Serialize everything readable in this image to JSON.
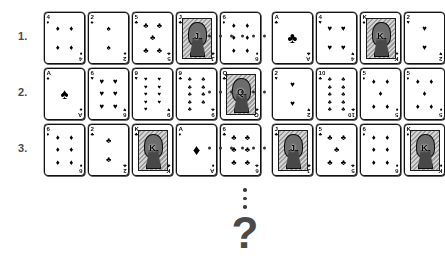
{
  "puzzle": {
    "title": "Playing card sequence puzzle",
    "row_separator_icon": "horizontal-ellipsis",
    "sequence_continuation_icon": "vertical-ellipsis",
    "answer_prompt": "?",
    "separator_dot_count": 6,
    "vertical_dot_count": 3,
    "colors": {
      "ink": "#1f1f1f",
      "paper": "#ffffff",
      "muted": "#4a4a4a",
      "face_art": "#9a9a9a"
    },
    "suit_glyphs": {
      "spades": "♠",
      "hearts": "♥",
      "diamonds": "♦",
      "clubs": "♣"
    },
    "rows": [
      {
        "label": "1.",
        "left": [
          {
            "rank": "4",
            "suit": "diamonds",
            "glyph": "♦",
            "pips": 4,
            "face": false
          },
          {
            "rank": "2",
            "suit": "spades",
            "glyph": "♠",
            "pips": 2,
            "face": false
          },
          {
            "rank": "5",
            "suit": "clubs",
            "glyph": "♣",
            "pips": 5,
            "face": false
          },
          {
            "rank": "J",
            "suit": "clubs",
            "glyph": "♣",
            "pips": 0,
            "face": true
          },
          {
            "rank": "6",
            "suit": "diamonds",
            "glyph": "♦",
            "pips": 6,
            "face": false
          }
        ],
        "right": [
          {
            "rank": "A",
            "suit": "clubs",
            "glyph": "♣",
            "pips": 1,
            "face": false
          },
          {
            "rank": "4",
            "suit": "hearts",
            "glyph": "♥",
            "pips": 4,
            "face": false
          },
          {
            "rank": "K",
            "suit": "spades",
            "glyph": "♠",
            "pips": 0,
            "face": true
          },
          {
            "rank": "2",
            "suit": "hearts",
            "glyph": "♥",
            "pips": 2,
            "face": false
          }
        ]
      },
      {
        "label": "2.",
        "left": [
          {
            "rank": "A",
            "suit": "spades",
            "glyph": "♠",
            "pips": 1,
            "face": false
          },
          {
            "rank": "6",
            "suit": "hearts",
            "glyph": "♥",
            "pips": 6,
            "face": false
          },
          {
            "rank": "9",
            "suit": "hearts",
            "glyph": "♥",
            "pips": 9,
            "face": false
          },
          {
            "rank": "9",
            "suit": "clubs",
            "glyph": "♣",
            "pips": 9,
            "face": false
          },
          {
            "rank": "Q",
            "suit": "clubs",
            "glyph": "♣",
            "pips": 0,
            "face": true
          }
        ],
        "right": [
          {
            "rank": "2",
            "suit": "hearts",
            "glyph": "♥",
            "pips": 2,
            "face": false
          },
          {
            "rank": "10",
            "suit": "clubs",
            "glyph": "♣",
            "pips": 10,
            "face": false
          },
          {
            "rank": "5",
            "suit": "diamonds",
            "glyph": "♦",
            "pips": 5,
            "face": false
          },
          {
            "rank": "5",
            "suit": "diamonds",
            "glyph": "♦",
            "pips": 5,
            "face": false
          }
        ]
      },
      {
        "label": "3.",
        "left": [
          {
            "rank": "6",
            "suit": "diamonds",
            "glyph": "♦",
            "pips": 6,
            "face": false
          },
          {
            "rank": "2",
            "suit": "clubs",
            "glyph": "♣",
            "pips": 2,
            "face": false
          },
          {
            "rank": "K",
            "suit": "clubs",
            "glyph": "♣",
            "pips": 0,
            "face": true
          },
          {
            "rank": "A",
            "suit": "diamonds",
            "glyph": "♦",
            "pips": 1,
            "face": false
          },
          {
            "rank": "6",
            "suit": "clubs",
            "glyph": "♣",
            "pips": 6,
            "face": false
          }
        ],
        "right": [
          {
            "rank": "J",
            "suit": "clubs",
            "glyph": "♣",
            "pips": 0,
            "face": true
          },
          {
            "rank": "5",
            "suit": "clubs",
            "glyph": "♣",
            "pips": 5,
            "face": false
          },
          {
            "rank": "6",
            "suit": "diamonds",
            "glyph": "♦",
            "pips": 6,
            "face": false
          },
          {
            "rank": "K",
            "suit": "diamonds",
            "glyph": "♦",
            "pips": 0,
            "face": true
          }
        ]
      }
    ]
  }
}
